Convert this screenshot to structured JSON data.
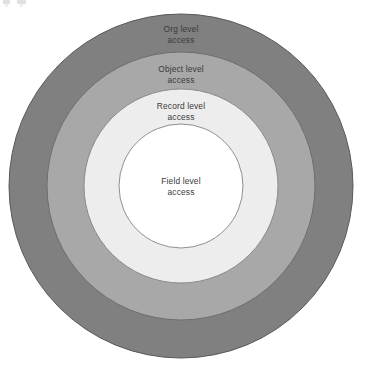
{
  "diagram": {
    "type": "concentric-circles",
    "background_color": "#ffffff",
    "center": {
      "x": 181,
      "y": 186
    },
    "text_color": "#3a3a3a",
    "stroke_color": "#5e5e5e",
    "rings": [
      {
        "id": "org",
        "order": 1,
        "label_line1": "Org level",
        "label_line2": "access",
        "radius": 172,
        "fill": "#808080",
        "stroke": "#585858"
      },
      {
        "id": "object",
        "order": 2,
        "label_line1": "Object level",
        "label_line2": "access",
        "radius": 134,
        "fill": "#a8a8a8",
        "stroke": "#6e6e6e"
      },
      {
        "id": "record",
        "order": 3,
        "label_line1": "Record level",
        "label_line2": "access",
        "radius": 97,
        "fill": "#ededed",
        "stroke": "#8a8a8a"
      },
      {
        "id": "field",
        "order": 4,
        "label_line1": "Field level",
        "label_line2": "access",
        "radius": 62,
        "fill": "#ffffff",
        "stroke": "#8f8f8f"
      }
    ]
  }
}
